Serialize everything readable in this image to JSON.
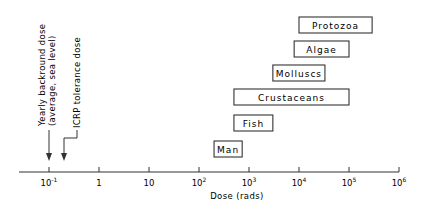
{
  "chart_data": {
    "type": "bar",
    "subtype": "horizontal-range",
    "title": "",
    "xlabel": "Dose (rads)",
    "ylabel": "",
    "xscale": "log",
    "xlim": [
      0.02,
      1000000
    ],
    "xticks": [
      {
        "value": 0.1,
        "label_base": "10",
        "label_exp": "-1"
      },
      {
        "value": 1,
        "label_base": "1",
        "label_exp": ""
      },
      {
        "value": 10,
        "label_base": "10",
        "label_exp": ""
      },
      {
        "value": 100,
        "label_base": "10",
        "label_exp": "2"
      },
      {
        "value": 1000,
        "label_base": "10",
        "label_exp": "3"
      },
      {
        "value": 10000,
        "label_base": "10",
        "label_exp": "4"
      },
      {
        "value": 100000,
        "label_base": "10",
        "label_exp": "5"
      },
      {
        "value": 1000000,
        "label_base": "10",
        "label_exp": "6"
      }
    ],
    "grid": false,
    "legend": null,
    "categories": [
      "Protozoa",
      "Algae",
      "Molluscs",
      "Crustaceans",
      "Fish",
      "Man"
    ],
    "series": [
      {
        "name": "Lethal dose range",
        "ranges": [
          {
            "label": "Protozoa",
            "min": 10000,
            "max": 290000
          },
          {
            "label": "Algae",
            "min": 8000,
            "max": 100000
          },
          {
            "label": "Molluscs",
            "min": 3000,
            "max": 33000
          },
          {
            "label": "Crustaceans",
            "min": 500,
            "max": 100000
          },
          {
            "label": "Fish",
            "min": 500,
            "max": 3000
          },
          {
            "label": "Man",
            "min": 200,
            "max": 730
          }
        ]
      }
    ],
    "annotations": [
      {
        "id": "background",
        "lines": [
          "Yearly backround dose",
          "(average, sea level)"
        ],
        "x_value": 0.1
      },
      {
        "id": "icrp",
        "lines": [
          "ICRP tolerance dose"
        ],
        "x_value": 0.2
      }
    ]
  }
}
